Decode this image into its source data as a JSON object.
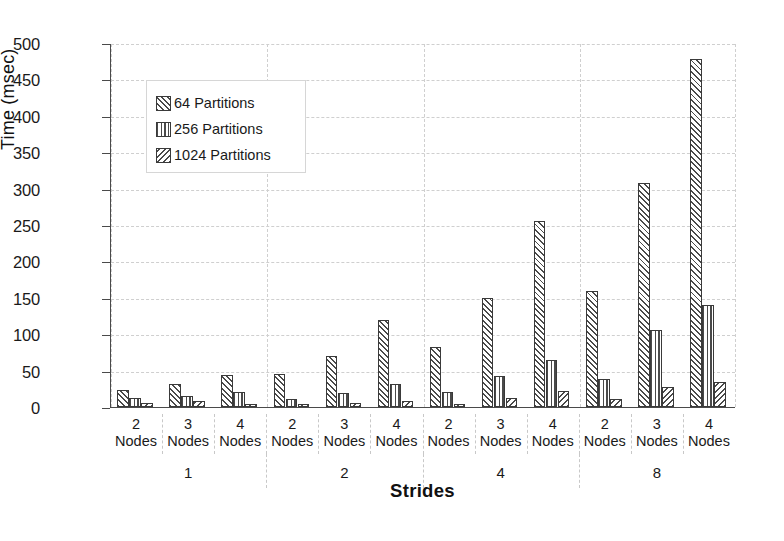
{
  "chart_data": {
    "type": "bar",
    "title": "",
    "xlabel": "Strides",
    "ylabel": "Time (msec)",
    "ylim": [
      0,
      500
    ],
    "ytick_step": 50,
    "yticks": [
      0,
      50,
      100,
      150,
      200,
      250,
      300,
      350,
      400,
      450,
      500
    ],
    "grid": true,
    "legend_position": "upper-left-inside",
    "group_outer_label": "Strides",
    "group_outer_categories": [
      "1",
      "2",
      "4",
      "8"
    ],
    "group_inner_categories": [
      "2\nNodes",
      "3\nNodes",
      "4\nNodes"
    ],
    "categories": [
      "1 / 2 Nodes",
      "1 / 3 Nodes",
      "1 / 4 Nodes",
      "2 / 2 Nodes",
      "2 / 3 Nodes",
      "2 / 4 Nodes",
      "4 / 2 Nodes",
      "4 / 3 Nodes",
      "4 / 4 Nodes",
      "8 / 2 Nodes",
      "8 / 3 Nodes",
      "8 / 4 Nodes"
    ],
    "series": [
      {
        "name": "64 Partitions",
        "pattern": "forward-diagonal-hatch",
        "values": [
          23,
          31,
          44,
          46,
          70,
          119,
          83,
          150,
          256,
          160,
          308,
          478
        ]
      },
      {
        "name": "256 Partitions",
        "pattern": "vertical-lines",
        "values": [
          12,
          15,
          21,
          11,
          19,
          32,
          20,
          42,
          64,
          38,
          106,
          140
        ]
      },
      {
        "name": "1024 Partitions",
        "pattern": "backward-diagonal-hatch",
        "values": [
          6,
          8,
          4,
          4,
          5,
          8,
          4,
          13,
          22,
          11,
          28,
          35
        ]
      }
    ]
  },
  "axis": {
    "y_title": "Time (msec)",
    "x_title": "Strides",
    "node_word": "Nodes"
  },
  "legend": {
    "items": [
      {
        "label": "64 Partitions"
      },
      {
        "label": "256 Partitions"
      },
      {
        "label": "1024 Partitions"
      }
    ]
  },
  "colors": {
    "hatch": "#4a4a4a",
    "axis": "#4a4a4a",
    "grid": "#cfcfcf",
    "background": "#ffffff",
    "text": "#1a1a1a"
  }
}
